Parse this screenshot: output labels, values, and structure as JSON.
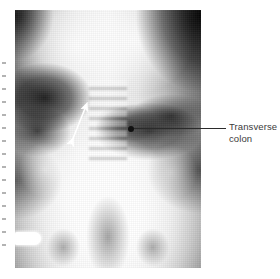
{
  "figure": {
    "type": "radiograph",
    "modality": "plain abdominal X-ray",
    "view": "anteroposterior"
  },
  "annotations": {
    "transverse_colon": {
      "label_line_1": "Transverse",
      "label_line_2": "colon",
      "marker": "leader-dot",
      "leader": "horizontal-line"
    },
    "arrow": {
      "name": "double-headed-arrow",
      "color": "#ffffff",
      "description": "white double-headed measurement arrow over the left gas-filled bowel"
    },
    "side_marker": {
      "name": "radio-opaque-side-marker",
      "color": "#ffffff"
    }
  },
  "colors": {
    "page_background": "#ffffff",
    "caption_text": "#3b3b3b",
    "leader_line": "#2b2b2b",
    "marker_dot": "#111111",
    "arrow": "#ffffff"
  },
  "margin_column": {
    "description": "cropped sliver of an adjacent text column at the left page edge",
    "tick_offsets": [
      0,
      13,
      26,
      39,
      52,
      65,
      78,
      91,
      104,
      117,
      130,
      143,
      156,
      169,
      182
    ]
  }
}
